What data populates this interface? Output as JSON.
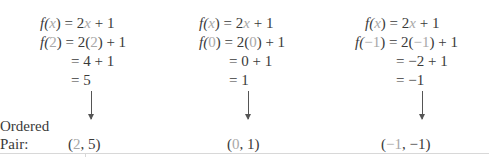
{
  "examples": [
    {
      "input": "2",
      "line1": {
        "lhs_f": "f(",
        "lhs_var": "x",
        "lhs_close": ")",
        "eq": " = 2",
        "var": "x",
        "rest": " + 1"
      },
      "line2": {
        "f": "f(",
        "val": "2",
        "close": ")",
        "eq": " = 2(",
        "val2": "2",
        "rest": ") + 1"
      },
      "line3": "= 4 + 1",
      "line4": "= 5",
      "pair": {
        "open": "(",
        "x": "2",
        "rest": ", 5)"
      }
    },
    {
      "input": "0",
      "line1": {
        "lhs_f": "f(",
        "lhs_var": "x",
        "lhs_close": ")",
        "eq": " = 2",
        "var": "x",
        "rest": " + 1"
      },
      "line2": {
        "f": "f(",
        "val": "0",
        "close": ")",
        "eq": " = 2(",
        "val2": "0",
        "rest": ") + 1"
      },
      "line3": "= 0 + 1",
      "line4": "= 1",
      "pair": {
        "open": "(",
        "x": "0",
        "rest": ", 1)"
      }
    },
    {
      "input": "−1",
      "line1": {
        "lhs_f": "f(",
        "lhs_var": "x",
        "lhs_close": ")",
        "eq": " = 2",
        "var": "x",
        "rest": " + 1"
      },
      "line2": {
        "f": "f(",
        "val": "−1",
        "close": ")",
        "eq": " = 2(",
        "val2": "−1",
        "rest": ") + 1"
      },
      "line3": "= −2 + 1",
      "line4": "= −1",
      "pair": {
        "open": "(",
        "x": "−1",
        "rest": ", −1)"
      }
    }
  ],
  "label": {
    "line1": "Ordered",
    "line2": "Pair:"
  },
  "colors": {
    "text": "#3a3a3a",
    "highlight": "#a8a8a8",
    "rule": "#d8d8d8"
  }
}
